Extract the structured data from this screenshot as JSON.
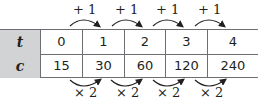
{
  "table": {
    "rows": [
      {
        "header": "t",
        "values": [
          "0",
          "1",
          "2",
          "3",
          "4"
        ]
      },
      {
        "header": "c",
        "values": [
          "15",
          "30",
          "60",
          "120",
          "240"
        ]
      }
    ]
  },
  "annotations": {
    "top": [
      "+ 1",
      "+ 1",
      "+ 1",
      "+ 1"
    ],
    "bottom": [
      "× 2",
      "× 2",
      "× 2",
      "× 2"
    ]
  },
  "colors": {
    "header_bg": "#d1d3d4",
    "border": "#6d6e71",
    "text": "#231f20"
  }
}
